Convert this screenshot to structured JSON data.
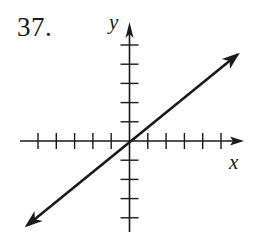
{
  "problem": {
    "number": "37."
  },
  "chart_data": {
    "type": "line",
    "title": "",
    "xlabel": "x",
    "ylabel": "y",
    "grid": false,
    "legend": null,
    "axis_ticks": {
      "x": [
        -5,
        -4,
        -3,
        -2,
        -1,
        1,
        2,
        3,
        4,
        5
      ],
      "y": [
        -4,
        -3,
        -2,
        -1,
        1,
        2,
        3,
        4,
        5
      ]
    },
    "xlim": [
      -6,
      6
    ],
    "ylim": [
      -5,
      6
    ],
    "series": [
      {
        "name": "line",
        "equation": "y = (3/4)x",
        "slope": 0.75,
        "intercept": 0,
        "x": [
          -5.6,
          0,
          5.9
        ],
        "y": [
          -4.4,
          0,
          4.5
        ],
        "arrows_both_ends": true
      }
    ]
  },
  "style": {
    "ink": "#1a1a1a",
    "background": "#ffffff"
  }
}
